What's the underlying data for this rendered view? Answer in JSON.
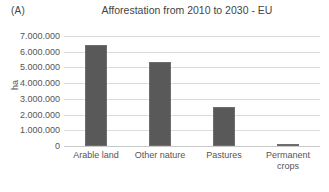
{
  "panel": {
    "label": "(A)"
  },
  "chart_data": {
    "type": "bar",
    "title": "Afforestation from 2010 to 2030 - EU",
    "xlabel": "",
    "ylabel": "ha",
    "categories": [
      "Arable land",
      "Other nature",
      "Pastures",
      "Permanent crops"
    ],
    "values": [
      6450000,
      5350000,
      2500000,
      50000
    ],
    "ylim": [
      0,
      7000000
    ],
    "ytick_values": [
      7000000,
      6000000,
      5000000,
      4000000,
      3000000,
      2000000,
      1000000,
      0
    ],
    "ytick_labels": [
      "7.000.000",
      "6.000.000",
      "5.000.000",
      "4.000.000",
      "3.000.000",
      "2.000.000",
      "1.000.000",
      "0"
    ],
    "grid": true,
    "legend": "none",
    "bar_color": "#595959",
    "grid_color": "#dcdcdc",
    "text_color": "#555555"
  }
}
